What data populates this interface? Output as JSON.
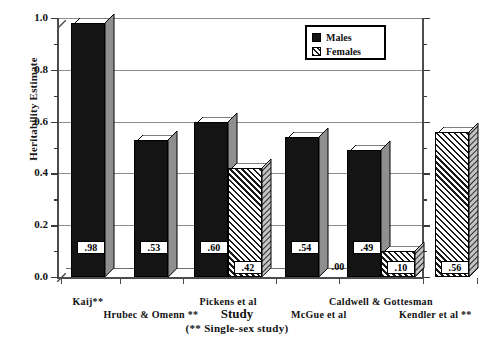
{
  "chart_data": {
    "type": "bar",
    "title": "",
    "xlabel": "Study",
    "xlabel_sub": "(** Single-sex study)",
    "ylabel": "Heritability Estimate",
    "ylim": [
      0.0,
      1.0
    ],
    "ytick_labels": [
      "0.0",
      "0.2",
      "0.4",
      "0.6",
      "0.8",
      "1.0"
    ],
    "ytick_values": [
      0.0,
      0.2,
      0.4,
      0.6,
      0.8,
      1.0
    ],
    "minor_tick_values": [
      0.1,
      0.3,
      0.5,
      0.7,
      0.9
    ],
    "grid": "horizontal",
    "legend_position": "top-right",
    "categories": [
      "Kaij**",
      "Hrubec & Omenn **",
      "Pickens et al",
      "McGue et al",
      "Caldwell & Gottesman",
      "Kendler et al **"
    ],
    "series": [
      {
        "name": "Males",
        "values": [
          0.98,
          0.53,
          0.6,
          0.54,
          0.49,
          null
        ],
        "labels": [
          ".98",
          ".53",
          ".60",
          ".54",
          ".49",
          ""
        ]
      },
      {
        "name": "Females",
        "values": [
          null,
          null,
          0.42,
          0.0,
          0.1,
          0.56
        ],
        "labels": [
          "",
          "",
          ".42",
          ".00",
          ".10",
          ".56"
        ]
      }
    ]
  },
  "legend": {
    "items": [
      {
        "label": "Males",
        "pattern": "solid-black"
      },
      {
        "label": "Females",
        "pattern": "diagonal-hatch"
      }
    ]
  },
  "axis": {
    "y_title": "Heritability Estimate",
    "x_title": "Study",
    "x_subtitle": "(** Single-sex study)"
  },
  "x_category_labels": [
    {
      "text": "Kaij**",
      "row": 0
    },
    {
      "text": "Hrubec & Omenn  **",
      "row": 1
    },
    {
      "text": "Pickens  et  al",
      "row": 0
    },
    {
      "text": "McGue et al",
      "row": 1
    },
    {
      "text": "Caldwell  &  Gottesman",
      "row": 0
    },
    {
      "text": "Kendler et al  **",
      "row": 1
    }
  ],
  "bar_value_labels": [
    ".98",
    ".53",
    ".60",
    ".42",
    ".54",
    ".00",
    ".49",
    ".10",
    ".56"
  ]
}
